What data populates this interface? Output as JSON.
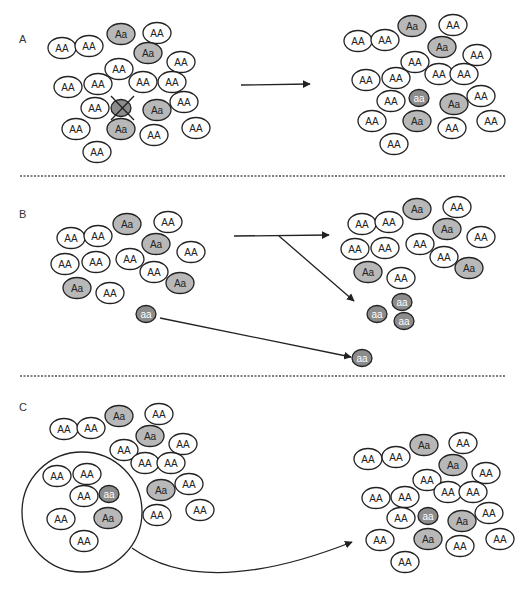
{
  "figure": {
    "width": 528,
    "height": 590,
    "colors": {
      "homozygous_dominant_fill": "#ffffff",
      "heterozygous_fill": "#b8b8b8",
      "homozygous_recessive_fill": "#8c8c8c",
      "outline": "#222222",
      "text_dark": "#222222",
      "text_light": "#ffffff",
      "divider": "#555555"
    },
    "genotype_labels": {
      "AA": "AA",
      "Aa": "Aa",
      "aa": "aa"
    }
  },
  "dividers": [
    {
      "x1": 20,
      "x2": 506,
      "y": 176
    },
    {
      "x1": 20,
      "x2": 506,
      "y": 376
    }
  ],
  "panels": [
    {
      "id": "A",
      "label": "A",
      "label_pos": [
        19,
        43
      ],
      "description": "Loss of a homozygous recessive individual",
      "arrows": [
        {
          "type": "straight",
          "from": [
            241,
            85
          ],
          "to": [
            310,
            84
          ]
        }
      ],
      "removed_marks": [
        {
          "cx": 121,
          "cy": 108,
          "genotype": "aa",
          "cross": [
            [
              111,
              96
            ],
            [
              134,
              120
            ],
            [
              134,
              96
            ],
            [
              111,
              120
            ]
          ]
        }
      ],
      "before": [
        {
          "g": "Aa",
          "x": 121,
          "y": 34
        },
        {
          "g": "AA",
          "x": 157,
          "y": 33
        },
        {
          "g": "AA",
          "x": 62,
          "y": 48
        },
        {
          "g": "AA",
          "x": 89,
          "y": 46
        },
        {
          "g": "Aa",
          "x": 148,
          "y": 53
        },
        {
          "g": "AA",
          "x": 181,
          "y": 62
        },
        {
          "g": "AA",
          "x": 119,
          "y": 69
        },
        {
          "g": "AA",
          "x": 68,
          "y": 87
        },
        {
          "g": "AA",
          "x": 98,
          "y": 84
        },
        {
          "g": "AA",
          "x": 143,
          "y": 82
        },
        {
          "g": "AA",
          "x": 172,
          "y": 82
        },
        {
          "g": "AA",
          "x": 95,
          "y": 108
        },
        {
          "g": "Aa",
          "x": 157,
          "y": 110
        },
        {
          "g": "AA",
          "x": 184,
          "y": 102
        },
        {
          "g": "AA",
          "x": 76,
          "y": 129
        },
        {
          "g": "Aa",
          "x": 121,
          "y": 129
        },
        {
          "g": "AA",
          "x": 154,
          "y": 135
        },
        {
          "g": "AA",
          "x": 196,
          "y": 128
        },
        {
          "g": "AA",
          "x": 97,
          "y": 152
        }
      ],
      "after": [
        {
          "g": "Aa",
          "x": 412,
          "y": 26
        },
        {
          "g": "AA",
          "x": 453,
          "y": 25
        },
        {
          "g": "AA",
          "x": 358,
          "y": 41
        },
        {
          "g": "AA",
          "x": 385,
          "y": 40
        },
        {
          "g": "Aa",
          "x": 442,
          "y": 47
        },
        {
          "g": "AA",
          "x": 477,
          "y": 55
        },
        {
          "g": "AA",
          "x": 415,
          "y": 62
        },
        {
          "g": "AA",
          "x": 366,
          "y": 80
        },
        {
          "g": "AA",
          "x": 396,
          "y": 78
        },
        {
          "g": "AA",
          "x": 439,
          "y": 74
        },
        {
          "g": "AA",
          "x": 464,
          "y": 74
        },
        {
          "g": "AA",
          "x": 391,
          "y": 101
        },
        {
          "g": "aa",
          "x": 419,
          "y": 98
        },
        {
          "g": "Aa",
          "x": 454,
          "y": 104
        },
        {
          "g": "AA",
          "x": 481,
          "y": 96
        },
        {
          "g": "AA",
          "x": 372,
          "y": 121
        },
        {
          "g": "Aa",
          "x": 417,
          "y": 121
        },
        {
          "g": "AA",
          "x": 452,
          "y": 128
        },
        {
          "g": "AA",
          "x": 491,
          "y": 121
        },
        {
          "g": "AA",
          "x": 394,
          "y": 144
        }
      ]
    },
    {
      "id": "B",
      "label": "B",
      "label_pos": [
        19,
        218
      ],
      "description": "Migration: individuals leave and form a new population",
      "arrows": [
        {
          "type": "straight",
          "from": [
            234,
            236
          ],
          "to": [
            329,
            235
          ]
        },
        {
          "type": "straight",
          "from": [
            279,
            236
          ],
          "to": [
            354,
            301
          ]
        },
        {
          "type": "straight",
          "from": [
            160,
            318
          ],
          "to": [
            351,
            357
          ]
        }
      ],
      "before": [
        {
          "g": "Aa",
          "x": 127,
          "y": 224
        },
        {
          "g": "AA",
          "x": 168,
          "y": 222
        },
        {
          "g": "AA",
          "x": 71,
          "y": 238
        },
        {
          "g": "AA",
          "x": 98,
          "y": 236
        },
        {
          "g": "Aa",
          "x": 156,
          "y": 244
        },
        {
          "g": "AA",
          "x": 191,
          "y": 252
        },
        {
          "g": "AA",
          "x": 65,
          "y": 264
        },
        {
          "g": "AA",
          "x": 96,
          "y": 262
        },
        {
          "g": "AA",
          "x": 130,
          "y": 259
        },
        {
          "g": "AA",
          "x": 154,
          "y": 272
        },
        {
          "g": "Aa",
          "x": 77,
          "y": 288
        },
        {
          "g": "AA",
          "x": 110,
          "y": 293
        },
        {
          "g": "Aa",
          "x": 180,
          "y": 283
        },
        {
          "g": "aa",
          "x": 146,
          "y": 314
        }
      ],
      "after": [
        {
          "g": "Aa",
          "x": 417,
          "y": 209
        },
        {
          "g": "AA",
          "x": 457,
          "y": 207
        },
        {
          "g": "AA",
          "x": 362,
          "y": 224
        },
        {
          "g": "AA",
          "x": 389,
          "y": 222
        },
        {
          "g": "Aa",
          "x": 447,
          "y": 229
        },
        {
          "g": "AA",
          "x": 481,
          "y": 237
        },
        {
          "g": "AA",
          "x": 355,
          "y": 249
        },
        {
          "g": "AA",
          "x": 385,
          "y": 248
        },
        {
          "g": "AA",
          "x": 420,
          "y": 244
        },
        {
          "g": "AA",
          "x": 444,
          "y": 257
        },
        {
          "g": "Aa",
          "x": 368,
          "y": 272
        },
        {
          "g": "AA",
          "x": 401,
          "y": 278
        },
        {
          "g": "Aa",
          "x": 469,
          "y": 268
        },
        {
          "g": "aa",
          "x": 402,
          "y": 302
        },
        {
          "g": "aa",
          "x": 377,
          "y": 314
        },
        {
          "g": "aa",
          "x": 404,
          "y": 321
        },
        {
          "g": "aa",
          "x": 362,
          "y": 358
        }
      ]
    },
    {
      "id": "C",
      "label": "C",
      "label_pos": [
        19,
        411
      ],
      "description": "Founder effect: a subset founds a new population",
      "founder_circle": {
        "cx": 82,
        "cy": 512,
        "r": 60
      },
      "arrows": [
        {
          "type": "curve",
          "path": "M 132 548 Q 205 600 352 542",
          "to": [
            352,
            542
          ]
        }
      ],
      "before": [
        {
          "g": "Aa",
          "x": 119,
          "y": 416
        },
        {
          "g": "AA",
          "x": 159,
          "y": 414
        },
        {
          "g": "AA",
          "x": 64,
          "y": 429
        },
        {
          "g": "AA",
          "x": 91,
          "y": 428
        },
        {
          "g": "Aa",
          "x": 150,
          "y": 436
        },
        {
          "g": "AA",
          "x": 183,
          "y": 444
        },
        {
          "g": "AA",
          "x": 124,
          "y": 450
        },
        {
          "g": "AA",
          "x": 145,
          "y": 463
        },
        {
          "g": "AA",
          "x": 171,
          "y": 463
        },
        {
          "g": "AA",
          "x": 189,
          "y": 484
        },
        {
          "g": "Aa",
          "x": 161,
          "y": 490
        },
        {
          "g": "AA",
          "x": 157,
          "y": 515
        },
        {
          "g": "AA",
          "x": 200,
          "y": 510
        },
        {
          "g": "AA",
          "x": 57,
          "y": 476
        },
        {
          "g": "AA",
          "x": 87,
          "y": 474
        },
        {
          "g": "AA",
          "x": 84,
          "y": 496
        },
        {
          "g": "aa",
          "x": 109,
          "y": 494
        },
        {
          "g": "AA",
          "x": 61,
          "y": 519
        },
        {
          "g": "Aa",
          "x": 108,
          "y": 518
        },
        {
          "g": "AA",
          "x": 84,
          "y": 541
        }
      ],
      "after": [
        {
          "g": "Aa",
          "x": 424,
          "y": 445
        },
        {
          "g": "AA",
          "x": 463,
          "y": 443
        },
        {
          "g": "AA",
          "x": 368,
          "y": 459
        },
        {
          "g": "AA",
          "x": 396,
          "y": 457
        },
        {
          "g": "Aa",
          "x": 453,
          "y": 465
        },
        {
          "g": "AA",
          "x": 486,
          "y": 473
        },
        {
          "g": "AA",
          "x": 427,
          "y": 480
        },
        {
          "g": "AA",
          "x": 376,
          "y": 498
        },
        {
          "g": "AA",
          "x": 405,
          "y": 497
        },
        {
          "g": "AA",
          "x": 448,
          "y": 492
        },
        {
          "g": "AA",
          "x": 473,
          "y": 492
        },
        {
          "g": "AA",
          "x": 401,
          "y": 518
        },
        {
          "g": "aa",
          "x": 428,
          "y": 516
        },
        {
          "g": "Aa",
          "x": 462,
          "y": 521
        },
        {
          "g": "AA",
          "x": 489,
          "y": 513
        },
        {
          "g": "AA",
          "x": 380,
          "y": 540
        },
        {
          "g": "Aa",
          "x": 428,
          "y": 539
        },
        {
          "g": "AA",
          "x": 460,
          "y": 546
        },
        {
          "g": "AA",
          "x": 500,
          "y": 539
        },
        {
          "g": "AA",
          "x": 405,
          "y": 562
        }
      ]
    }
  ]
}
